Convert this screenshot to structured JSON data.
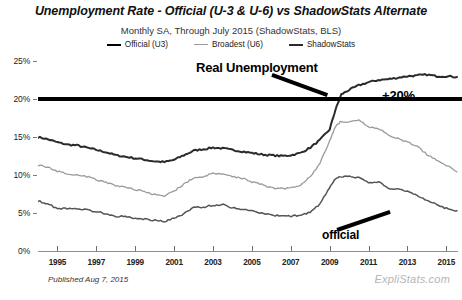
{
  "header": {
    "title": "Unemployment Rate - Official (U-3 & U-6) vs ShadowStats Alternate",
    "subtitle": "Monthly SA, Through July 2015  (ShadowStats, BLS)"
  },
  "legend": {
    "position": "top-center",
    "items": [
      {
        "label": "Official (U3)",
        "color": "#000000"
      },
      {
        "label": "Broadest (U6)",
        "color": "#9a9a9a"
      },
      {
        "label": "ShadowStats",
        "color": "#2b2b2b"
      }
    ]
  },
  "annotations": [
    {
      "name": "real-unemployment",
      "text": "Real Unemployment"
    },
    {
      "name": "plus-twenty",
      "text": "+20%"
    },
    {
      "name": "official",
      "text": "official"
    }
  ],
  "footer": {
    "published": "Published Aug 7, 2015",
    "watermark": "ExpliStats.com"
  },
  "chart_data": {
    "type": "line",
    "title": "Unemployment Rate - Official (U-3 & U-6) vs ShadowStats Alternate",
    "subtitle": "Monthly SA, Through July 2015  (ShadowStats, BLS)",
    "xlabel": "",
    "ylabel": "",
    "xlim": [
      1994.0,
      2015.6
    ],
    "ylim": [
      0,
      26
    ],
    "grid": false,
    "y_ticks": [
      "0%",
      "5%",
      "10%",
      "15%",
      "20%",
      "25%"
    ],
    "y_tick_values": [
      0,
      5,
      10,
      15,
      20,
      25
    ],
    "x_ticks": [
      "1995",
      "1997",
      "1999",
      "2001",
      "2003",
      "2005",
      "2007",
      "2009",
      "2011",
      "2013",
      "2015"
    ],
    "x_tick_values": [
      1995,
      1997,
      1999,
      2001,
      2003,
      2005,
      2007,
      2009,
      2011,
      2013,
      2015
    ],
    "reference_line": {
      "label": "+20%",
      "value": 20,
      "color": "#000000",
      "width": 4
    },
    "x": [
      1994.0,
      1994.5,
      1995.0,
      1995.5,
      1996.0,
      1996.5,
      1997.0,
      1997.5,
      1998.0,
      1998.5,
      1999.0,
      1999.5,
      2000.0,
      2000.5,
      2001.0,
      2001.5,
      2002.0,
      2002.5,
      2003.0,
      2003.5,
      2004.0,
      2004.5,
      2005.0,
      2005.5,
      2006.0,
      2006.5,
      2007.0,
      2007.5,
      2008.0,
      2008.5,
      2009.0,
      2009.3,
      2009.6,
      2010.0,
      2010.5,
      2011.0,
      2011.5,
      2012.0,
      2012.5,
      2013.0,
      2013.5,
      2014.0,
      2014.5,
      2015.0,
      2015.55
    ],
    "series": [
      {
        "name": "ShadowStats",
        "color": "#2b2b2b",
        "values": [
          15.0,
          14.7,
          14.3,
          14.0,
          13.9,
          13.6,
          13.3,
          13.0,
          12.6,
          12.4,
          12.2,
          12.0,
          11.8,
          11.7,
          12.0,
          12.6,
          13.2,
          13.4,
          13.6,
          13.5,
          13.3,
          13.1,
          12.9,
          12.7,
          12.6,
          12.5,
          12.6,
          12.9,
          13.6,
          14.6,
          16.0,
          18.6,
          20.6,
          21.2,
          21.8,
          22.2,
          22.5,
          22.6,
          22.8,
          23.0,
          23.1,
          23.2,
          23.0,
          23.0,
          22.9
        ]
      },
      {
        "name": "Broadest (U6)",
        "color": "#9a9a9a",
        "values": [
          11.3,
          11.0,
          10.5,
          10.2,
          10.0,
          9.8,
          9.4,
          9.0,
          8.6,
          8.4,
          8.1,
          7.8,
          7.4,
          7.2,
          7.9,
          8.8,
          9.6,
          9.8,
          10.2,
          10.1,
          9.8,
          9.6,
          9.1,
          8.8,
          8.3,
          8.2,
          8.3,
          8.7,
          9.8,
          11.5,
          14.5,
          16.4,
          17.1,
          16.9,
          17.2,
          16.3,
          16.1,
          15.3,
          14.8,
          14.3,
          13.8,
          12.7,
          12.0,
          11.3,
          10.4
        ]
      },
      {
        "name": "Official (U3)",
        "color": "#555555",
        "values": [
          6.6,
          6.2,
          5.6,
          5.6,
          5.6,
          5.4,
          5.2,
          4.9,
          4.6,
          4.5,
          4.3,
          4.2,
          4.0,
          3.9,
          4.3,
          4.9,
          5.7,
          5.8,
          6.0,
          6.1,
          5.7,
          5.5,
          5.3,
          5.0,
          4.7,
          4.6,
          4.6,
          4.7,
          5.1,
          6.2,
          8.3,
          9.5,
          9.8,
          9.8,
          9.6,
          9.0,
          9.1,
          8.3,
          8.1,
          7.9,
          7.3,
          6.7,
          6.1,
          5.6,
          5.3
        ]
      }
    ]
  }
}
